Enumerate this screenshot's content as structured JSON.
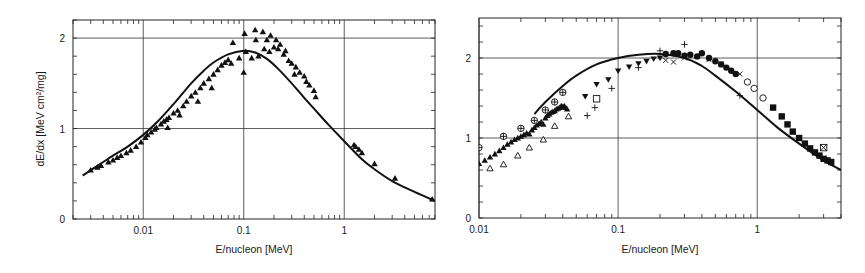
{
  "chart_data": [
    {
      "type": "scatter",
      "panel": "left",
      "title": "",
      "xlabel": "E/nucleon [MeV]",
      "ylabel": "dE/dx [MeV cm²/mg]",
      "xscale": "log",
      "xlim": [
        0.002,
        8
      ],
      "ylim": [
        0,
        2.2
      ],
      "xticks": [
        {
          "value": 0.01,
          "label": "0.01"
        },
        {
          "value": 0.1,
          "label": "0.1"
        },
        {
          "value": 1,
          "label": "1"
        }
      ],
      "yticks": [
        {
          "value": 0,
          "label": "0"
        },
        {
          "value": 1,
          "label": "1"
        },
        {
          "value": 2,
          "label": "2"
        }
      ],
      "grid": true,
      "legend": null,
      "curve": {
        "name": "theory",
        "x": [
          0.0025,
          0.003,
          0.004,
          0.005,
          0.007,
          0.01,
          0.014,
          0.02,
          0.03,
          0.04,
          0.05,
          0.07,
          0.1,
          0.13,
          0.17,
          0.22,
          0.3,
          0.4,
          0.5,
          0.7,
          1.0,
          1.5,
          2.0,
          3.0,
          5.0,
          8.0
        ],
        "y": [
          0.48,
          0.54,
          0.63,
          0.7,
          0.8,
          0.93,
          1.08,
          1.27,
          1.5,
          1.64,
          1.73,
          1.82,
          1.86,
          1.84,
          1.77,
          1.66,
          1.5,
          1.34,
          1.22,
          1.04,
          0.86,
          0.66,
          0.55,
          0.42,
          0.3,
          0.2
        ]
      },
      "series": [
        {
          "name": "data (filled triangles)",
          "marker": "triangle-filled",
          "points": [
            [
              0.003,
              0.54
            ],
            [
              0.0035,
              0.57
            ],
            [
              0.0038,
              0.59
            ],
            [
              0.0045,
              0.63
            ],
            [
              0.005,
              0.65
            ],
            [
              0.0055,
              0.68
            ],
            [
              0.006,
              0.7
            ],
            [
              0.0068,
              0.73
            ],
            [
              0.0075,
              0.76
            ],
            [
              0.0085,
              0.8
            ],
            [
              0.0095,
              0.85
            ],
            [
              0.0105,
              0.9
            ],
            [
              0.011,
              0.93
            ],
            [
              0.012,
              0.96
            ],
            [
              0.013,
              0.99
            ],
            [
              0.0135,
              1.01
            ],
            [
              0.015,
              1.05
            ],
            [
              0.016,
              1.08
            ],
            [
              0.017,
              1.1
            ],
            [
              0.0175,
              1.01
            ],
            [
              0.018,
              1.12
            ],
            [
              0.02,
              1.17
            ],
            [
              0.022,
              1.2
            ],
            [
              0.023,
              1.15
            ],
            [
              0.025,
              1.25
            ],
            [
              0.027,
              1.3
            ],
            [
              0.03,
              1.36
            ],
            [
              0.033,
              1.4
            ],
            [
              0.035,
              1.3
            ],
            [
              0.037,
              1.45
            ],
            [
              0.04,
              1.5
            ],
            [
              0.045,
              1.55
            ],
            [
              0.048,
              1.45
            ],
            [
              0.05,
              1.6
            ],
            [
              0.055,
              1.65
            ],
            [
              0.06,
              1.7
            ],
            [
              0.065,
              1.73
            ],
            [
              0.07,
              1.76
            ],
            [
              0.075,
              1.72
            ],
            [
              0.078,
              1.95
            ],
            [
              0.09,
              1.78
            ],
            [
              0.1,
              1.62
            ],
            [
              0.102,
              2.05
            ],
            [
              0.105,
              1.85
            ],
            [
              0.12,
              1.78
            ],
            [
              0.13,
              2.09
            ],
            [
              0.132,
              1.98
            ],
            [
              0.14,
              1.8
            ],
            [
              0.155,
              2.07
            ],
            [
              0.16,
              1.88
            ],
            [
              0.17,
              1.98
            ],
            [
              0.18,
              1.85
            ],
            [
              0.185,
              2.03
            ],
            [
              0.2,
              1.9
            ],
            [
              0.21,
              1.98
            ],
            [
              0.22,
              1.88
            ],
            [
              0.23,
              1.93
            ],
            [
              0.25,
              1.82
            ],
            [
              0.26,
              1.86
            ],
            [
              0.28,
              1.75
            ],
            [
              0.3,
              1.72
            ],
            [
              0.32,
              1.6
            ],
            [
              0.33,
              1.68
            ],
            [
              0.36,
              1.62
            ],
            [
              0.4,
              1.58
            ],
            [
              0.42,
              1.52
            ],
            [
              0.45,
              1.48
            ],
            [
              0.5,
              1.42
            ],
            [
              0.52,
              1.35
            ],
            [
              1.25,
              0.82
            ],
            [
              1.3,
              0.8
            ],
            [
              1.4,
              0.77
            ],
            [
              1.5,
              0.73
            ],
            [
              2.0,
              0.61
            ],
            [
              3.2,
              0.45
            ],
            [
              7.5,
              0.22
            ]
          ]
        }
      ]
    },
    {
      "type": "scatter",
      "panel": "right",
      "title": "",
      "xlabel": "E/nucleon [MeV]",
      "ylabel": "",
      "xscale": "log",
      "xlim": [
        0.01,
        4
      ],
      "ylim": [
        0,
        2.5
      ],
      "xticks": [
        {
          "value": 0.01,
          "label": "0.01"
        },
        {
          "value": 0.1,
          "label": "0.1"
        },
        {
          "value": 1,
          "label": "1"
        }
      ],
      "yticks": [
        {
          "value": 0,
          "label": "0"
        },
        {
          "value": 1,
          "label": "1"
        },
        {
          "value": 2,
          "label": "2"
        }
      ],
      "grid": true,
      "legend": null,
      "curve": {
        "name": "theory",
        "x": [
          0.025,
          0.03,
          0.04,
          0.05,
          0.07,
          0.1,
          0.14,
          0.2,
          0.3,
          0.4,
          0.5,
          0.7,
          1.0,
          1.4,
          2.0,
          3.0,
          4.0
        ],
        "y": [
          1.3,
          1.45,
          1.65,
          1.78,
          1.92,
          2.0,
          2.04,
          2.05,
          2.0,
          1.9,
          1.78,
          1.58,
          1.35,
          1.13,
          0.93,
          0.72,
          0.6
        ]
      },
      "series": [
        {
          "name": "filled triangles up",
          "marker": "triangle-filled",
          "points": [
            [
              0.01,
              0.68
            ],
            [
              0.011,
              0.72
            ],
            [
              0.012,
              0.76
            ],
            [
              0.013,
              0.8
            ],
            [
              0.014,
              0.84
            ],
            [
              0.015,
              0.88
            ],
            [
              0.016,
              0.92
            ],
            [
              0.017,
              0.95
            ],
            [
              0.018,
              0.98
            ],
            [
              0.019,
              1.0
            ],
            [
              0.02,
              1.02
            ],
            [
              0.021,
              1.04
            ],
            [
              0.022,
              1.06
            ],
            [
              0.023,
              1.05
            ],
            [
              0.024,
              1.1
            ],
            [
              0.025,
              1.13
            ],
            [
              0.026,
              1.16
            ],
            [
              0.027,
              1.18
            ],
            [
              0.028,
              1.2
            ],
            [
              0.029,
              1.17
            ],
            [
              0.03,
              1.25
            ],
            [
              0.031,
              1.28
            ],
            [
              0.032,
              1.3
            ],
            [
              0.033,
              1.32
            ],
            [
              0.034,
              1.33
            ],
            [
              0.035,
              1.34
            ],
            [
              0.036,
              1.36
            ],
            [
              0.037,
              1.37
            ],
            [
              0.038,
              1.38
            ],
            [
              0.039,
              1.4
            ],
            [
              0.04,
              1.39
            ],
            [
              0.041,
              1.4
            ],
            [
              0.042,
              1.38
            ],
            [
              0.043,
              1.36
            ]
          ]
        },
        {
          "name": "open triangles",
          "marker": "triangle-open",
          "points": [
            [
              0.012,
              0.62
            ],
            [
              0.015,
              0.67
            ],
            [
              0.019,
              0.78
            ],
            [
              0.023,
              0.88
            ],
            [
              0.029,
              0.98
            ],
            [
              0.035,
              1.15
            ],
            [
              0.044,
              1.27
            ]
          ]
        },
        {
          "name": "circled plus",
          "marker": "circle-plus",
          "points": [
            [
              0.01,
              0.88
            ],
            [
              0.015,
              1.02
            ],
            [
              0.02,
              1.12
            ],
            [
              0.025,
              1.22
            ],
            [
              0.03,
              1.35
            ],
            [
              0.035,
              1.45
            ],
            [
              0.04,
              1.57
            ]
          ]
        },
        {
          "name": "filled triangles down",
          "marker": "triangledown-filled",
          "points": [
            [
              0.058,
              1.52
            ],
            [
              0.07,
              1.67
            ],
            [
              0.085,
              1.73
            ],
            [
              0.1,
              1.84
            ],
            [
              0.12,
              1.89
            ],
            [
              0.14,
              1.93
            ],
            [
              0.16,
              1.96
            ],
            [
              0.18,
              1.99
            ],
            [
              0.2,
              2.0
            ]
          ]
        },
        {
          "name": "open squares",
          "marker": "square-open",
          "points": [
            [
              0.07,
              1.49
            ]
          ]
        },
        {
          "name": "plus",
          "marker": "plus",
          "points": [
            [
              0.06,
              1.28
            ],
            [
              0.068,
              1.38
            ],
            [
              0.09,
              1.62
            ],
            [
              0.14,
              1.88
            ],
            [
              0.2,
              2.09
            ],
            [
              0.3,
              2.17
            ],
            [
              0.75,
              1.53
            ]
          ]
        },
        {
          "name": "crosses",
          "marker": "x",
          "points": [
            [
              0.22,
              1.97
            ],
            [
              0.25,
              1.95
            ],
            [
              0.3,
              2.0
            ],
            [
              0.45,
              1.98
            ],
            [
              0.55,
              1.93
            ],
            [
              0.75,
              1.8
            ]
          ]
        },
        {
          "name": "filled circles",
          "marker": "circle-filled",
          "points": [
            [
              0.22,
              2.05
            ],
            [
              0.25,
              2.06
            ],
            [
              0.27,
              2.06
            ],
            [
              0.3,
              2.03
            ],
            [
              0.33,
              2.04
            ],
            [
              0.37,
              2.02
            ],
            [
              0.4,
              2.06
            ],
            [
              0.45,
              2.0
            ],
            [
              0.5,
              1.96
            ],
            [
              0.55,
              1.92
            ],
            [
              0.6,
              1.88
            ],
            [
              0.65,
              1.84
            ],
            [
              0.7,
              1.8
            ]
          ]
        },
        {
          "name": "open circles",
          "marker": "circle-open",
          "points": [
            [
              0.85,
              1.7
            ],
            [
              0.95,
              1.62
            ],
            [
              1.1,
              1.5
            ]
          ]
        },
        {
          "name": "filled squares",
          "marker": "square-filled",
          "points": [
            [
              1.3,
              1.38
            ],
            [
              1.5,
              1.27
            ],
            [
              1.65,
              1.17
            ],
            [
              1.8,
              1.08
            ],
            [
              2.0,
              1.0
            ],
            [
              2.2,
              0.93
            ],
            [
              2.4,
              0.87
            ],
            [
              2.6,
              0.82
            ],
            [
              2.8,
              0.78
            ],
            [
              3.0,
              0.74
            ],
            [
              3.2,
              0.72
            ],
            [
              3.4,
              0.7
            ]
          ]
        },
        {
          "name": "boxed cross",
          "marker": "square-x",
          "points": [
            [
              3.0,
              0.88
            ]
          ]
        }
      ]
    }
  ],
  "left": {
    "xlabel": "E/nucleon [MeV]",
    "ylabel": "dE/dx [MeV cm²/mg]"
  },
  "right": {
    "xlabel": "E/nucleon [MeV]"
  }
}
